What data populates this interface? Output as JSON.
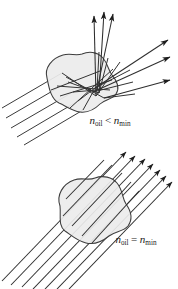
{
  "figure": {
    "name": "refractive-index-matching-diagram",
    "background_color": "#ffffff",
    "width": 178,
    "height": 289,
    "blob_fill_color": "#ececec",
    "blob_stroke_color": "#3d3d3d",
    "ray_color": "#2e2e2e",
    "arrowhead_color": "#1d1d1d",
    "label_color": "#1a1a1a"
  },
  "panels": [
    {
      "id": "top",
      "name": "mismatched-index-panel",
      "description": "Light rays entering an irregular particle scatter in many directions",
      "incoming_ray_count": 5,
      "outgoing_ray_count": 6,
      "rays_deviated": true,
      "label": {
        "symbol_left": "n",
        "subscript_left": "oil",
        "relation": "<",
        "symbol_right": "n",
        "subscript_right": "min",
        "text": "n_oil < n_min"
      }
    },
    {
      "id": "bottom",
      "name": "matched-index-panel",
      "description": "Light rays pass straight through the particle undeviated",
      "incoming_ray_count": 7,
      "outgoing_ray_count": 7,
      "rays_deviated": false,
      "label": {
        "symbol_left": "n",
        "subscript_left": "oil",
        "relation": "=",
        "symbol_right": "n",
        "subscript_right": "min",
        "text": "n_oil = n_min"
      }
    }
  ]
}
